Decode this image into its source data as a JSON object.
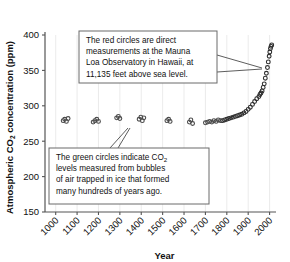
{
  "chart_data": {
    "type": "scatter",
    "title": "",
    "xlabel": "Year",
    "ylabel": "Atmospheric CO2 concentration (ppm)",
    "ylabel_parts": {
      "pre": "Atmospheric CO",
      "sub": "2",
      "post": " concentration (ppm)"
    },
    "xlim": [
      950,
      2030
    ],
    "ylim": [
      150,
      400
    ],
    "xticks": [
      1000,
      1100,
      1200,
      1300,
      1400,
      1500,
      1600,
      1700,
      1800,
      1900,
      2000
    ],
    "yticks": [
      150,
      200,
      250,
      300,
      350,
      400
    ],
    "grid": true,
    "grid_axis": "x",
    "legend": "none",
    "point_color": "#3a3a3a",
    "series": [
      {
        "name": "Ice core bubble measurements (green circles)",
        "marker": "circle",
        "color": "#4a4a4a",
        "points": [
          [
            1035,
            279
          ],
          [
            1042,
            281
          ],
          [
            1050,
            278
          ],
          [
            1058,
            282
          ],
          [
            1175,
            277
          ],
          [
            1183,
            279
          ],
          [
            1192,
            281
          ],
          [
            1200,
            278
          ],
          [
            1285,
            283
          ],
          [
            1293,
            285
          ],
          [
            1300,
            282
          ],
          [
            1390,
            281
          ],
          [
            1398,
            284
          ],
          [
            1405,
            279
          ],
          [
            1412,
            283
          ],
          [
            1520,
            279
          ],
          [
            1528,
            281
          ],
          [
            1535,
            278
          ],
          [
            1625,
            277
          ],
          [
            1632,
            280
          ],
          [
            1640,
            275
          ],
          [
            1700,
            276
          ],
          [
            1710,
            277
          ],
          [
            1720,
            278
          ],
          [
            1730,
            277
          ],
          [
            1740,
            279
          ],
          [
            1750,
            278
          ],
          [
            1760,
            280
          ],
          [
            1770,
            279
          ]
        ]
      },
      {
        "name": "Mauna Loa Observatory direct measurements (red circles)",
        "marker": "circle",
        "color": "#2e2e2e",
        "points": [
          [
            1780,
            279
          ],
          [
            1790,
            280
          ],
          [
            1800,
            281
          ],
          [
            1810,
            282
          ],
          [
            1820,
            283
          ],
          [
            1830,
            284
          ],
          [
            1840,
            285
          ],
          [
            1850,
            286
          ],
          [
            1860,
            287
          ],
          [
            1870,
            288
          ],
          [
            1880,
            290
          ],
          [
            1890,
            292
          ],
          [
            1900,
            295
          ],
          [
            1910,
            298
          ],
          [
            1920,
            302
          ],
          [
            1930,
            306
          ],
          [
            1940,
            310
          ],
          [
            1950,
            313
          ],
          [
            1955,
            316
          ],
          [
            1960,
            318
          ],
          [
            1965,
            321
          ],
          [
            1970,
            326
          ],
          [
            1975,
            331
          ],
          [
            1980,
            339
          ],
          [
            1985,
            346
          ],
          [
            1990,
            354
          ],
          [
            1994,
            362
          ],
          [
            1998,
            370
          ],
          [
            2001,
            376
          ],
          [
            2004,
            381
          ],
          [
            2007,
            384
          ],
          [
            2010,
            386
          ]
        ]
      }
    ],
    "annotations": [
      {
        "id": "red-circles-callout",
        "lines": [
          "The red circles are direct",
          "measurements at the Mauna",
          "Loa Observatory in Hawaii, at",
          "11,135 feet above sea level."
        ],
        "box": {
          "x": 79,
          "y": 31,
          "w": 138,
          "h": 52
        },
        "leaders": [
          {
            "x1": 217,
            "y1": 55,
            "x2": 262,
            "y2": 68
          },
          {
            "x1": 217,
            "y1": 72,
            "x2": 262,
            "y2": 69
          }
        ]
      },
      {
        "id": "green-circles-callout",
        "lines_rich": [
          {
            "pre": "The green circles indicate CO",
            "sub": "2",
            "post": ""
          },
          {
            "pre": "levels measured from bubbles",
            "sub": "",
            "post": ""
          },
          {
            "pre": "of air trapped in ice that formed",
            "sub": "",
            "post": ""
          },
          {
            "pre": "many hundreds of years ago.",
            "sub": "",
            "post": ""
          }
        ],
        "box": {
          "x": 49,
          "y": 148,
          "w": 160,
          "h": 56
        },
        "leaders": [
          {
            "x1": 110,
            "y1": 148,
            "x2": 128,
            "y2": 128
          },
          {
            "x1": 118,
            "y1": 148,
            "x2": 130,
            "y2": 128
          }
        ]
      }
    ]
  }
}
